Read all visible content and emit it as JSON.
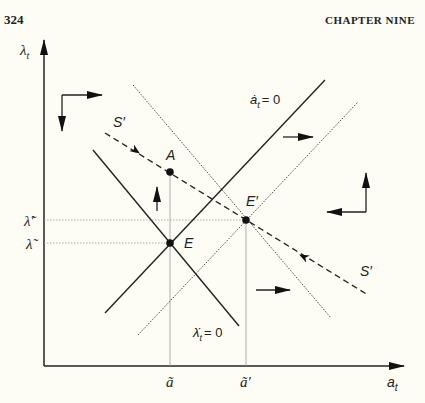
{
  "header": {
    "page_number": "324",
    "chapter": "CHAPTER NINE"
  },
  "diagram": {
    "axes": {
      "y_label": "λ",
      "y_sub": "t",
      "x_label": "a",
      "x_sub": "t"
    },
    "y_ticks": [
      {
        "label": "λ̃′",
        "y": 220
      },
      {
        "label": "λ̃",
        "y": 243
      }
    ],
    "x_ticks": [
      {
        "label": "ã",
        "x": 170
      },
      {
        "label": "ã′",
        "x": 246
      }
    ],
    "points": [
      {
        "name": "A",
        "x": 170,
        "y": 172
      },
      {
        "name": "E",
        "x": 170,
        "y": 243
      },
      {
        "name": "E′",
        "x": 246,
        "y": 220
      }
    ],
    "curves": [
      {
        "name": "a-dot-zero",
        "label": "ȧ",
        "label_sub": "t",
        "label_rest": "= 0",
        "style": "solid"
      },
      {
        "name": "lambda-dot-zero",
        "label": "λ̇",
        "label_sub": "t",
        "label_rest": "= 0",
        "style": "solid"
      },
      {
        "name": "a-dot-zero-shifted",
        "style": "dotted"
      },
      {
        "name": "lambda-dot-zero-shifted",
        "style": "dotted"
      },
      {
        "name": "saddle-path",
        "label": "S′",
        "style": "dashed"
      }
    ],
    "saddle_labels": [
      "S′",
      "S′"
    ]
  }
}
